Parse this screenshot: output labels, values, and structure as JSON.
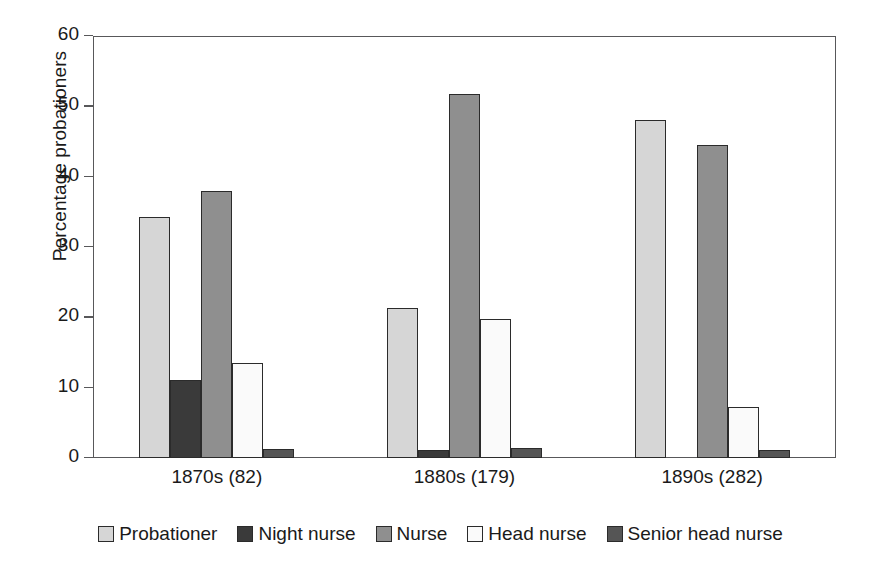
{
  "chart_data": {
    "type": "bar",
    "title": "",
    "xlabel": "",
    "ylabel": "Percentage probationers",
    "ylim": [
      0,
      60
    ],
    "yticks": [
      0,
      10,
      20,
      30,
      40,
      50,
      60
    ],
    "ytick_labels": [
      "0",
      "10",
      "20",
      "30",
      "40",
      "50",
      "60"
    ],
    "grid": false,
    "legend_position": "bottom",
    "categories": [
      "1870s (82)",
      "1880s (179)",
      "1890s (282)"
    ],
    "series": [
      {
        "name": "Probationer",
        "color": "#d6d6d6",
        "values": [
          34.2,
          21.3,
          48.0
        ]
      },
      {
        "name": "Night nurse",
        "color": "#3a3a3a",
        "values": [
          11.1,
          1.2,
          0
        ]
      },
      {
        "name": "Nurse",
        "color": "#8f8f8f",
        "values": [
          37.9,
          51.7,
          44.5
        ]
      },
      {
        "name": "Head nurse",
        "color": "#fafafa",
        "values": [
          13.5,
          19.8,
          7.2
        ]
      },
      {
        "name": "Senior head nurse",
        "color": "#555555",
        "values": [
          1.3,
          1.4,
          1.1
        ]
      }
    ]
  },
  "axis": {
    "y_title": "Percentage probationers",
    "y_tick_0": "0",
    "y_tick_1": "10",
    "y_tick_2": "20",
    "y_tick_3": "30",
    "y_tick_4": "40",
    "y_tick_5": "50",
    "y_tick_6": "60",
    "x_label_0": "1870s (82)",
    "x_label_1": "1880s (179)",
    "x_label_2": "1890s (282)"
  },
  "legend": {
    "items": [
      {
        "label": "Probationer",
        "color": "#d6d6d6"
      },
      {
        "label": "Night nurse",
        "color": "#3a3a3a"
      },
      {
        "label": "Nurse",
        "color": "#8f8f8f"
      },
      {
        "label": "Head nurse",
        "color": "#fafafa"
      },
      {
        "label": "Senior head nurse",
        "color": "#555555"
      }
    ]
  }
}
